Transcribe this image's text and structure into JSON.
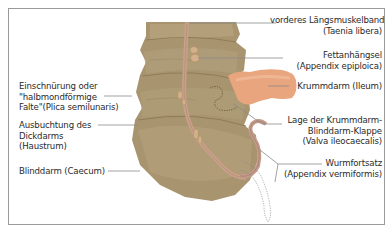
{
  "figure": {
    "colors": {
      "colon": "#a8946f",
      "colon_light": "#b9a67f",
      "colon_shadow": "#8f7c5a",
      "taenia": "#c9a08a",
      "ileum": "#e8a57e",
      "appendix": "#c49a8a",
      "leader_line": "#8a8a8a",
      "frame_border": "#9a9a9a"
    },
    "labels_right": [
      {
        "line1": "vorderes Längsmuskelband",
        "line2": "(Taenia libera)"
      },
      {
        "line1": "Fettanhängsel",
        "line2": "(Appendix epiploica)"
      },
      {
        "line1": "Krummdarm (Ileum)"
      },
      {
        "line1": "Lage der Krummdarm-",
        "line2": "Blinddarm-Klappe",
        "line3": "(Valva ileocaecalis)"
      },
      {
        "line1": "Wurmfortsatz",
        "line2": "(Appendix vermiformis)"
      }
    ],
    "labels_left": [
      {
        "line1": "Einschnürung oder",
        "line2": "\"halbmondförmige",
        "line3": "Falte\"(Plica semilunaris)"
      },
      {
        "line1": "Ausbuchtung des",
        "line2": "Dickdarms",
        "line3": "(Haustrum)"
      },
      {
        "line1": "Blinddarm (Caecum)"
      }
    ]
  }
}
